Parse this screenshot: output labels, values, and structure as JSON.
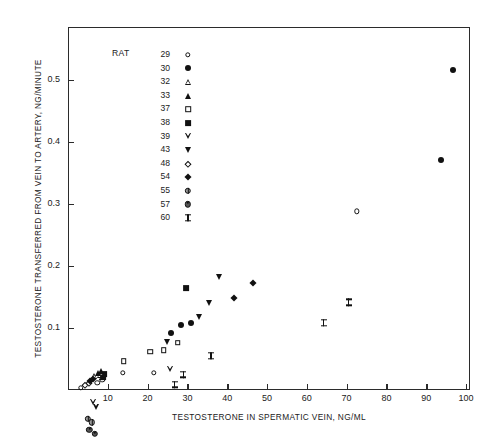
{
  "chart_data": {
    "type": "scatter",
    "title": "",
    "xlabel": "TESTOSTERONE IN SPERMATIC VEIN, NG/ML",
    "ylabel": "TESTOSTERONE TRANSFERRED FROM VEIN TO ARTERY, NG/MINUTE",
    "xlim": [
      0,
      101
    ],
    "ylim": [
      0,
      0.585
    ],
    "xticks": [
      10,
      20,
      30,
      40,
      50,
      60,
      70,
      80,
      90,
      100
    ],
    "xticklabels": [
      "10",
      "20",
      "30",
      "40",
      "50",
      "60",
      "70",
      "80",
      "90",
      "100"
    ],
    "yticks": [
      0.1,
      0.2,
      0.3,
      0.4,
      0.5
    ],
    "yticklabels": [
      "0.1",
      "0.2",
      "0.3",
      "0.4",
      "0.5"
    ],
    "grid": false,
    "legend_position": "upper-left-inside",
    "legend_title": "RAT",
    "series": [
      {
        "name": "29",
        "marker": "circle-open",
        "points": [
          [
            3.2,
            0.004
          ],
          [
            7.4,
            0.012
          ],
          [
            8.6,
            0.016
          ],
          [
            13.8,
            0.028
          ],
          [
            21.5,
            0.028
          ],
          [
            72.5,
            0.288
          ]
        ]
      },
      {
        "name": "30",
        "marker": "circle-fill",
        "points": [
          [
            26.0,
            0.092
          ],
          [
            28.4,
            0.104
          ],
          [
            31.0,
            0.108
          ],
          [
            93.8,
            0.37
          ],
          [
            96.8,
            0.515
          ]
        ]
      },
      {
        "name": "32",
        "marker": "tri-up-open",
        "points": [
          [
            6.6,
            0.022
          ],
          [
            8.0,
            0.034
          ],
          [
            8.6,
            0.04
          ]
        ]
      },
      {
        "name": "33",
        "marker": "tri-up-fill",
        "points": [
          [
            7.6,
            0.028
          ],
          [
            8.4,
            0.03
          ]
        ]
      },
      {
        "name": "37",
        "marker": "sq-open",
        "points": [
          [
            14.0,
            0.046
          ],
          [
            20.6,
            0.062
          ],
          [
            24.0,
            0.064
          ],
          [
            27.6,
            0.076
          ]
        ]
      },
      {
        "name": "38",
        "marker": "sq-fill",
        "points": [
          [
            8.8,
            0.02
          ],
          [
            9.2,
            0.026
          ],
          [
            29.6,
            0.164
          ]
        ]
      },
      {
        "name": "39",
        "marker": "tri-dn-open",
        "points": [
          [
            6.4,
            0.01
          ],
          [
            7.0,
            0.012
          ],
          [
            25.6,
            0.082
          ]
        ]
      },
      {
        "name": "43",
        "marker": "tri-dn-fill",
        "points": [
          [
            24.8,
            0.078
          ],
          [
            33.0,
            0.118
          ],
          [
            35.4,
            0.14
          ],
          [
            38.0,
            0.182
          ]
        ]
      },
      {
        "name": "48",
        "marker": "diamond-open",
        "points": [
          [
            4.2,
            0.008
          ],
          [
            5.2,
            0.012
          ]
        ]
      },
      {
        "name": "54",
        "marker": "diamond-fill",
        "points": [
          [
            5.6,
            0.014
          ],
          [
            6.2,
            0.018
          ],
          [
            41.6,
            0.148
          ],
          [
            46.4,
            0.172
          ]
        ]
      },
      {
        "name": "55",
        "marker": "circle-cross",
        "points": [
          [
            5.0,
            0.012
          ],
          [
            6.0,
            0.016
          ]
        ]
      },
      {
        "name": "57",
        "marker": "circle-dot",
        "points": [
          [
            5.4,
            0.014
          ],
          [
            6.8,
            0.018
          ]
        ]
      },
      {
        "name": "60",
        "marker": "ibeam",
        "points": [
          [
            26.8,
            0.108
          ],
          [
            29.0,
            0.136
          ],
          [
            36.0,
            0.178
          ],
          [
            64.2,
            0.243
          ],
          [
            70.5,
            0.288
          ]
        ]
      }
    ],
    "legend_entries": [
      {
        "label": "29",
        "marker": "circle-open"
      },
      {
        "label": "30",
        "marker": "circle-fill"
      },
      {
        "label": "32",
        "marker": "tri-up-open"
      },
      {
        "label": "33",
        "marker": "tri-up-fill"
      },
      {
        "label": "37",
        "marker": "sq-open"
      },
      {
        "label": "38",
        "marker": "sq-fill"
      },
      {
        "label": "39",
        "marker": "tri-dn-open"
      },
      {
        "label": "43",
        "marker": "tri-dn-fill"
      },
      {
        "label": "48",
        "marker": "diamond-open"
      },
      {
        "label": "54",
        "marker": "diamond-fill"
      },
      {
        "label": "55",
        "marker": "circle-cross"
      },
      {
        "label": "57",
        "marker": "circle-dot"
      },
      {
        "label": "60",
        "marker": "ibeam"
      }
    ],
    "colors": {
      "marker": "#111111",
      "axis": "#2b2b2b",
      "background": "#ffffff"
    }
  }
}
